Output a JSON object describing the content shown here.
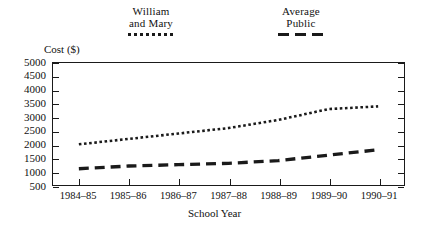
{
  "chart_data": {
    "type": "line",
    "title": "",
    "xlabel": "School Year",
    "ylabel": "Cost ($)",
    "categories": [
      "1984–85",
      "1985–86",
      "1986–87",
      "1987–88",
      "1988–89",
      "1989–90",
      "1990–91"
    ],
    "ylim": [
      500,
      5000
    ],
    "ytick_labels": [
      "5000",
      "4500",
      "4000",
      "3500",
      "3000",
      "2500",
      "2000",
      "1500",
      "1000",
      "500"
    ],
    "ytick_values": [
      5000,
      4500,
      4000,
      3500,
      3000,
      2500,
      2000,
      1500,
      1000,
      500
    ],
    "grid": false,
    "legend_position": "top",
    "series": [
      {
        "name": "William and Mary",
        "style": "dotted",
        "color": "#1a1a1a",
        "values": [
          2000,
          2200,
          2400,
          2600,
          2900,
          3300,
          3400
        ]
      },
      {
        "name": "Average Public",
        "style": "dashed",
        "color": "#1a1a1a",
        "values": [
          1100,
          1200,
          1250,
          1300,
          1400,
          1600,
          1800
        ]
      }
    ]
  },
  "legend": {
    "entries": [
      {
        "line1": "William",
        "line2": "and Mary",
        "marker": "dotted-line-swatch"
      },
      {
        "line1": "Average",
        "line2": "Public",
        "marker": "dashed-line-swatch"
      }
    ]
  },
  "axes": {
    "y_title": "Cost ($)",
    "x_title": "School Year"
  }
}
